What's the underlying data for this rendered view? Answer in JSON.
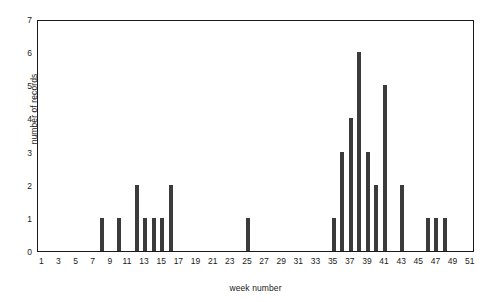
{
  "chart_data": {
    "type": "bar",
    "title": "",
    "subtitle": "",
    "xlabel": "week number",
    "ylabel": "number of records",
    "xlim": [
      0.5,
      51.5
    ],
    "ylim": [
      0,
      7
    ],
    "grid": false,
    "legend": null,
    "bar_color": "#3b3b3b",
    "axis_color": "#1a1a1a",
    "background_color": "#ffffff",
    "x_tick_labels": [
      "1",
      "3",
      "5",
      "7",
      "9",
      "11",
      "13",
      "15",
      "17",
      "19",
      "21",
      "23",
      "25",
      "27",
      "29",
      "31",
      "33",
      "35",
      "37",
      "39",
      "41",
      "43",
      "45",
      "47",
      "49",
      "51"
    ],
    "x_tick_values": [
      1,
      3,
      5,
      7,
      9,
      11,
      13,
      15,
      17,
      19,
      21,
      23,
      25,
      27,
      29,
      31,
      33,
      35,
      37,
      39,
      41,
      43,
      45,
      47,
      49,
      51
    ],
    "y_tick_labels": [
      "0",
      "1",
      "2",
      "3",
      "4",
      "5",
      "6",
      "7"
    ],
    "y_tick_values": [
      0,
      1,
      2,
      3,
      4,
      5,
      6,
      7
    ],
    "categories": [
      1,
      2,
      3,
      4,
      5,
      6,
      7,
      8,
      9,
      10,
      11,
      12,
      13,
      14,
      15,
      16,
      17,
      18,
      19,
      20,
      21,
      22,
      23,
      24,
      25,
      26,
      27,
      28,
      29,
      30,
      31,
      32,
      33,
      34,
      35,
      36,
      37,
      38,
      39,
      40,
      41,
      42,
      43,
      44,
      45,
      46,
      47,
      48,
      49,
      50,
      51
    ],
    "values": [
      0,
      0,
      0,
      0,
      0,
      0,
      0,
      1,
      0,
      1,
      0,
      2,
      1,
      1,
      1,
      2,
      0,
      0,
      0,
      0,
      0,
      0,
      0,
      0,
      1,
      0,
      0,
      0,
      0,
      0,
      0,
      0,
      0,
      0,
      1,
      3,
      4,
      6,
      3,
      2,
      5,
      0,
      2,
      0,
      0,
      1,
      1,
      1,
      0,
      0,
      0
    ],
    "nonzero_points": [
      {
        "week": 8,
        "records": 1
      },
      {
        "week": 10,
        "records": 1
      },
      {
        "week": 12,
        "records": 2
      },
      {
        "week": 13,
        "records": 1
      },
      {
        "week": 14,
        "records": 1
      },
      {
        "week": 15,
        "records": 1
      },
      {
        "week": 16,
        "records": 2
      },
      {
        "week": 25,
        "records": 1
      },
      {
        "week": 35,
        "records": 1
      },
      {
        "week": 36,
        "records": 3
      },
      {
        "week": 37,
        "records": 4
      },
      {
        "week": 38,
        "records": 6
      },
      {
        "week": 39,
        "records": 3
      },
      {
        "week": 40,
        "records": 2
      },
      {
        "week": 41,
        "records": 5
      },
      {
        "week": 43,
        "records": 2
      },
      {
        "week": 46,
        "records": 1
      },
      {
        "week": 47,
        "records": 1
      },
      {
        "week": 48,
        "records": 1
      }
    ]
  }
}
